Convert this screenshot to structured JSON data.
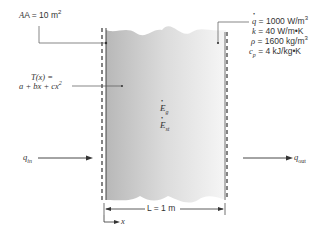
{
  "diagram": {
    "type": "plane wall heat conduction",
    "area_label": {
      "prefix": "A = 10 m",
      "exp": "2"
    },
    "temperature_label": {
      "line1": "T(x) =",
      "line2": "a + bx + cx",
      "exp": "2"
    },
    "properties": {
      "q_dot": {
        "symbol": "q",
        "value": " = 1000 W/m",
        "exp": "3"
      },
      "k": {
        "symbol": "k",
        "value": " = 40 W/m•K"
      },
      "rho": {
        "symbol": "ρ",
        "value": " = 1600 kg/m",
        "exp": "3"
      },
      "cp": {
        "symbol": "c",
        "sub": "p",
        "value": " = 4 kJ/kg•K"
      }
    },
    "energy_terms": [
      {
        "symbol": "E",
        "sub": "g"
      },
      {
        "symbol": "E",
        "sub": "st"
      }
    ],
    "q_in": {
      "symbol": "q",
      "sub": "in"
    },
    "q_out": {
      "symbol": "q",
      "sub": "out"
    },
    "length_label": "L = 1 m",
    "x_axis_label": "x",
    "colors": {
      "wall_dark": "#b8b8b8",
      "wall_light": "#f4f4f4",
      "line": "#333333"
    }
  }
}
